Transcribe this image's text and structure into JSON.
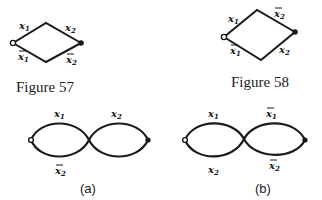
{
  "figures": [
    {
      "id": "fig57",
      "caption": "Figure 57",
      "shape": "rhombus",
      "edges": {
        "top_left": {
          "var": "x",
          "sub": "1",
          "negated": false
        },
        "top_right": {
          "var": "x",
          "sub": "2",
          "negated": false
        },
        "bottom_left": {
          "var": "x",
          "sub": "1",
          "negated": true
        },
        "bottom_right": {
          "var": "x",
          "sub": "2",
          "negated": true
        }
      },
      "terminals": {
        "left": "open-circle",
        "right": "filled-dot"
      }
    },
    {
      "id": "fig58",
      "caption": "Figure 58",
      "shape": "rhombus",
      "edges": {
        "top_left": {
          "var": "x",
          "sub": "1",
          "negated": false
        },
        "top_right": {
          "var": "x",
          "sub": "2",
          "negated": true
        },
        "bottom_left": {
          "var": "x",
          "sub": "1",
          "negated": true
        },
        "bottom_right": {
          "var": "x",
          "sub": "2",
          "negated": false
        }
      },
      "terminals": {
        "left": "open-circle",
        "right": "filled-dot"
      }
    },
    {
      "id": "fig-a",
      "caption": "(a)",
      "shape": "figure-eight",
      "edges": {
        "left_top": {
          "var": "x",
          "sub": "1",
          "negated": false
        },
        "right_top": {
          "var": "x",
          "sub": "2",
          "negated": false
        },
        "left_bottom": {
          "var": "x",
          "sub": "2",
          "negated": true
        }
      },
      "terminals": {
        "left": "open-circle",
        "right": "filled-dot"
      }
    },
    {
      "id": "fig-b",
      "caption": "(b)",
      "shape": "figure-eight",
      "edges": {
        "left_top": {
          "var": "x",
          "sub": "1",
          "negated": false
        },
        "right_top": {
          "var": "x",
          "sub": "1",
          "negated": true
        },
        "left_bottom": {
          "var": "x",
          "sub": "2",
          "negated": false
        },
        "right_bottom": {
          "var": "x",
          "sub": "2",
          "negated": true
        }
      },
      "terminals": {
        "left": "open-circle",
        "right": "filled-dot"
      }
    }
  ],
  "labels": {
    "var": "x",
    "sub1": "1",
    "sub2": "2",
    "cap57": "Figure 57",
    "cap58": "Figure 58",
    "capa": "(a)",
    "capb": "(b)"
  }
}
